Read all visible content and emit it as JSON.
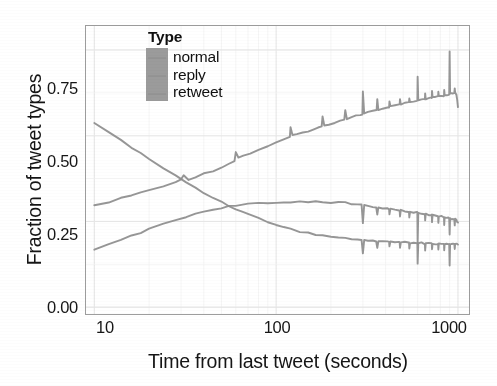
{
  "chart_data": {
    "type": "line",
    "title": "",
    "xlabel": "Time from last tweet (seconds)",
    "ylabel": "Fraction of tweet types",
    "xscale": "log",
    "yscale": "linear",
    "xlim": [
      9.0,
      1150
    ],
    "ylim": [
      -0.02,
      0.82
    ],
    "xticks": [
      10,
      100,
      1000
    ],
    "xticklabels": [
      "10",
      "100",
      "1000"
    ],
    "yticks": [
      0.0,
      0.25,
      0.5,
      0.75
    ],
    "yticklabels": [
      "0.00",
      "0.25",
      "0.50",
      "0.75"
    ],
    "grid": "minor-light-gray",
    "legend": {
      "title": "Type",
      "position": "top-left-inside",
      "entries": [
        "normal",
        "reply",
        "retweet"
      ]
    },
    "series": [
      {
        "name": "normal",
        "color": "#8d8d8d",
        "description": "rises monotonically with periodic upward spikes at round-number intervals",
        "points": [
          [
            10,
            0.295
          ],
          [
            12,
            0.307
          ],
          [
            14,
            0.317
          ],
          [
            16,
            0.326
          ],
          [
            18,
            0.334
          ],
          [
            20,
            0.341
          ],
          [
            24,
            0.353
          ],
          [
            28,
            0.363
          ],
          [
            30,
            0.372
          ],
          [
            31,
            0.385
          ],
          [
            33,
            0.373
          ],
          [
            36,
            0.38
          ],
          [
            40,
            0.389
          ],
          [
            45,
            0.398
          ],
          [
            50,
            0.408
          ],
          [
            55,
            0.418
          ],
          [
            59,
            0.428
          ],
          [
            60,
            0.452
          ],
          [
            62,
            0.437
          ],
          [
            66,
            0.441
          ],
          [
            72,
            0.449
          ],
          [
            80,
            0.459
          ],
          [
            90,
            0.47
          ],
          [
            100,
            0.48
          ],
          [
            110,
            0.488
          ],
          [
            119,
            0.496
          ],
          [
            120,
            0.525
          ],
          [
            123,
            0.5
          ],
          [
            130,
            0.503
          ],
          [
            140,
            0.509
          ],
          [
            150,
            0.514
          ],
          [
            160,
            0.519
          ],
          [
            170,
            0.523
          ],
          [
            178,
            0.527
          ],
          [
            180,
            0.555
          ],
          [
            184,
            0.53
          ],
          [
            195,
            0.534
          ],
          [
            210,
            0.539
          ],
          [
            225,
            0.544
          ],
          [
            237,
            0.548
          ],
          [
            240,
            0.575
          ],
          [
            245,
            0.55
          ],
          [
            260,
            0.554
          ],
          [
            275,
            0.558
          ],
          [
            290,
            0.561
          ],
          [
            298,
            0.563
          ],
          [
            300,
            0.628
          ],
          [
            305,
            0.565
          ],
          [
            320,
            0.568
          ],
          [
            340,
            0.571
          ],
          [
            357,
            0.574
          ],
          [
            360,
            0.605
          ],
          [
            365,
            0.576
          ],
          [
            385,
            0.579
          ],
          [
            410,
            0.582
          ],
          [
            418,
            0.584
          ],
          [
            420,
            0.6
          ],
          [
            425,
            0.585
          ],
          [
            450,
            0.588
          ],
          [
            475,
            0.59
          ],
          [
            478,
            0.592
          ],
          [
            480,
            0.605
          ],
          [
            485,
            0.592
          ],
          [
            510,
            0.594
          ],
          [
            535,
            0.596
          ],
          [
            538,
            0.597
          ],
          [
            540,
            0.609
          ],
          [
            545,
            0.597
          ],
          [
            570,
            0.599
          ],
          [
            595,
            0.601
          ],
          [
            598,
            0.602
          ],
          [
            600,
            0.672
          ],
          [
            605,
            0.602
          ],
          [
            630,
            0.604
          ],
          [
            655,
            0.606
          ],
          [
            658,
            0.607
          ],
          [
            660,
            0.622
          ],
          [
            665,
            0.607
          ],
          [
            690,
            0.608
          ],
          [
            715,
            0.61
          ],
          [
            718,
            0.611
          ],
          [
            720,
            0.63
          ],
          [
            725,
            0.611
          ],
          [
            750,
            0.612
          ],
          [
            775,
            0.614
          ],
          [
            778,
            0.615
          ],
          [
            780,
            0.628
          ],
          [
            785,
            0.615
          ],
          [
            810,
            0.616
          ],
          [
            835,
            0.617
          ],
          [
            838,
            0.618
          ],
          [
            840,
            0.632
          ],
          [
            845,
            0.618
          ],
          [
            865,
            0.619
          ],
          [
            885,
            0.62
          ],
          [
            895,
            0.621
          ],
          [
            900,
            0.748
          ],
          [
            905,
            0.621
          ],
          [
            920,
            0.622
          ],
          [
            940,
            0.623
          ],
          [
            955,
            0.624
          ],
          [
            960,
            0.64
          ],
          [
            965,
            0.624
          ],
          [
            980,
            0.618
          ],
          [
            990,
            0.605
          ],
          [
            1000,
            0.585
          ]
        ]
      },
      {
        "name": "reply",
        "color": "#8d8d8d",
        "description": "rises from 0.165 to a plateau near 0.30 then declines with downward spikes",
        "points": [
          [
            10,
            0.166
          ],
          [
            12,
            0.182
          ],
          [
            14,
            0.196
          ],
          [
            16,
            0.208
          ],
          [
            18,
            0.218
          ],
          [
            20,
            0.227
          ],
          [
            24,
            0.242
          ],
          [
            28,
            0.254
          ],
          [
            32,
            0.264
          ],
          [
            36,
            0.272
          ],
          [
            40,
            0.279
          ],
          [
            45,
            0.285
          ],
          [
            50,
            0.29
          ],
          [
            55,
            0.294
          ],
          [
            60,
            0.296
          ],
          [
            70,
            0.3
          ],
          [
            80,
            0.302
          ],
          [
            90,
            0.303
          ],
          [
            100,
            0.304
          ],
          [
            110,
            0.305
          ],
          [
            120,
            0.307
          ],
          [
            135,
            0.308
          ],
          [
            150,
            0.308
          ],
          [
            165,
            0.308
          ],
          [
            180,
            0.307
          ],
          [
            200,
            0.306
          ],
          [
            220,
            0.305
          ],
          [
            240,
            0.304
          ],
          [
            260,
            0.301
          ],
          [
            280,
            0.299
          ],
          [
            295,
            0.298
          ],
          [
            300,
            0.247
          ],
          [
            305,
            0.297
          ],
          [
            320,
            0.295
          ],
          [
            340,
            0.293
          ],
          [
            355,
            0.292
          ],
          [
            360,
            0.268
          ],
          [
            365,
            0.291
          ],
          [
            385,
            0.289
          ],
          [
            410,
            0.287
          ],
          [
            418,
            0.286
          ],
          [
            420,
            0.272
          ],
          [
            425,
            0.286
          ],
          [
            450,
            0.284
          ],
          [
            475,
            0.283
          ],
          [
            478,
            0.282
          ],
          [
            480,
            0.266
          ],
          [
            485,
            0.282
          ],
          [
            510,
            0.28
          ],
          [
            535,
            0.279
          ],
          [
            538,
            0.278
          ],
          [
            540,
            0.262
          ],
          [
            545,
            0.278
          ],
          [
            570,
            0.277
          ],
          [
            595,
            0.276
          ],
          [
            598,
            0.275
          ],
          [
            600,
            0.186
          ],
          [
            605,
            0.275
          ],
          [
            630,
            0.274
          ],
          [
            655,
            0.273
          ],
          [
            658,
            0.272
          ],
          [
            660,
            0.252
          ],
          [
            665,
            0.272
          ],
          [
            690,
            0.27
          ],
          [
            715,
            0.269
          ],
          [
            718,
            0.268
          ],
          [
            720,
            0.248
          ],
          [
            725,
            0.268
          ],
          [
            750,
            0.267
          ],
          [
            775,
            0.266
          ],
          [
            778,
            0.265
          ],
          [
            780,
            0.246
          ],
          [
            785,
            0.265
          ],
          [
            810,
            0.264
          ],
          [
            835,
            0.263
          ],
          [
            838,
            0.262
          ],
          [
            840,
            0.241
          ],
          [
            845,
            0.262
          ],
          [
            865,
            0.261
          ],
          [
            885,
            0.26
          ],
          [
            895,
            0.259
          ],
          [
            900,
            0.214
          ],
          [
            905,
            0.259
          ],
          [
            920,
            0.258
          ],
          [
            940,
            0.257
          ],
          [
            955,
            0.256
          ],
          [
            960,
            0.24
          ],
          [
            965,
            0.256
          ],
          [
            980,
            0.253
          ],
          [
            990,
            0.25
          ],
          [
            1000,
            0.248
          ]
        ]
      },
      {
        "name": "retweet",
        "color": "#8d8d8d",
        "description": "declines from 0.54 down to about 0.185 with downward spikes at round intervals",
        "points": [
          [
            10,
            0.539
          ],
          [
            12,
            0.511
          ],
          [
            14,
            0.487
          ],
          [
            16,
            0.466
          ],
          [
            18,
            0.448
          ],
          [
            20,
            0.432
          ],
          [
            24,
            0.405
          ],
          [
            28,
            0.383
          ],
          [
            32,
            0.364
          ],
          [
            36,
            0.348
          ],
          [
            40,
            0.334
          ],
          [
            45,
            0.319
          ],
          [
            50,
            0.307
          ],
          [
            55,
            0.296
          ],
          [
            60,
            0.287
          ],
          [
            65,
            0.278
          ],
          [
            70,
            0.271
          ],
          [
            80,
            0.259
          ],
          [
            90,
            0.249
          ],
          [
            100,
            0.241
          ],
          [
            110,
            0.234
          ],
          [
            120,
            0.228
          ],
          [
            135,
            0.221
          ],
          [
            150,
            0.216
          ],
          [
            165,
            0.212
          ],
          [
            180,
            0.209
          ],
          [
            200,
            0.206
          ],
          [
            220,
            0.203
          ],
          [
            240,
            0.201
          ],
          [
            260,
            0.199
          ],
          [
            280,
            0.197
          ],
          [
            295,
            0.196
          ],
          [
            300,
            0.155
          ],
          [
            305,
            0.196
          ],
          [
            320,
            0.195
          ],
          [
            340,
            0.194
          ],
          [
            355,
            0.193
          ],
          [
            360,
            0.173
          ],
          [
            365,
            0.193
          ],
          [
            385,
            0.192
          ],
          [
            410,
            0.191
          ],
          [
            418,
            0.191
          ],
          [
            420,
            0.176
          ],
          [
            425,
            0.191
          ],
          [
            450,
            0.19
          ],
          [
            475,
            0.19
          ],
          [
            478,
            0.189
          ],
          [
            480,
            0.174
          ],
          [
            485,
            0.189
          ],
          [
            510,
            0.189
          ],
          [
            535,
            0.188
          ],
          [
            538,
            0.188
          ],
          [
            540,
            0.172
          ],
          [
            545,
            0.188
          ],
          [
            570,
            0.188
          ],
          [
            595,
            0.187
          ],
          [
            598,
            0.187
          ],
          [
            600,
            0.126
          ],
          [
            605,
            0.187
          ],
          [
            630,
            0.187
          ],
          [
            655,
            0.186
          ],
          [
            658,
            0.186
          ],
          [
            660,
            0.167
          ],
          [
            665,
            0.186
          ],
          [
            690,
            0.186
          ],
          [
            715,
            0.186
          ],
          [
            718,
            0.185
          ],
          [
            720,
            0.167
          ],
          [
            725,
            0.185
          ],
          [
            750,
            0.185
          ],
          [
            775,
            0.185
          ],
          [
            778,
            0.185
          ],
          [
            780,
            0.166
          ],
          [
            785,
            0.185
          ],
          [
            810,
            0.185
          ],
          [
            835,
            0.185
          ],
          [
            838,
            0.184
          ],
          [
            840,
            0.165
          ],
          [
            845,
            0.184
          ],
          [
            865,
            0.184
          ],
          [
            885,
            0.184
          ],
          [
            895,
            0.184
          ],
          [
            900,
            0.121
          ],
          [
            905,
            0.184
          ],
          [
            920,
            0.184
          ],
          [
            940,
            0.184
          ],
          [
            955,
            0.184
          ],
          [
            960,
            0.168
          ],
          [
            965,
            0.184
          ],
          [
            980,
            0.184
          ],
          [
            990,
            0.184
          ],
          [
            1000,
            0.184
          ]
        ]
      }
    ]
  },
  "axes": {
    "y_title": "Fraction of tweet types",
    "x_title": "Time from last tweet (seconds)",
    "y_ticks": [
      {
        "label": "0.75"
      },
      {
        "label": "0.50"
      },
      {
        "label": "0.25"
      },
      {
        "label": "0.00"
      }
    ],
    "x_ticks": [
      {
        "label": "10"
      },
      {
        "label": "100"
      },
      {
        "label": "1000"
      }
    ]
  },
  "legend": {
    "title": "Type",
    "items": [
      {
        "label": "normal"
      },
      {
        "label": "reply"
      },
      {
        "label": "retweet"
      }
    ],
    "swatch_color": "#9b9b9b"
  },
  "colors": {
    "line": "#8d8d8d",
    "panel_border": "#9d9d9d",
    "grid": "#f1f1f1",
    "text": "#151515",
    "background": "#ffffff"
  }
}
